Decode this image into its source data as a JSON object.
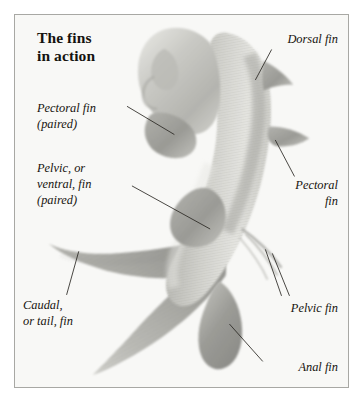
{
  "figure": {
    "title": "The fins\nin action",
    "background_color": "#f8f8f6",
    "border_color": "#a8a8a4",
    "page_color": "#ffffff",
    "ink_color": "#17140f",
    "fish_gray": "#9a9a96"
  },
  "labels": {
    "pectoral_left": "Pectoral fin\n(paired)",
    "pelvic_left": "Pelvic, or\nventral, fin\n(paired)",
    "caudal": "Caudal,\nor tail, fin",
    "dorsal": "Dorsal fin",
    "pectoral_right": "Pectoral\nfin",
    "pelvic_right": "Pelvic fin",
    "anal": "Anal fin"
  }
}
